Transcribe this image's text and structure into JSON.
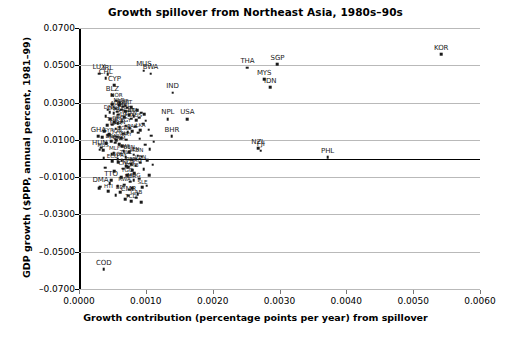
{
  "chart_data": {
    "type": "scatter",
    "title": "Growth spillover from Northeast Asia, 1980s–90s",
    "xlabel": "Growth contribution (percentage points per year) from spillover",
    "ylabel": "GDP growth ($PPP, annual percent, 1981–99)",
    "xlim": [
      0.0,
      0.006
    ],
    "ylim": [
      -0.07,
      0.07
    ],
    "xticks": [
      "0.0000",
      "0.0010",
      "0.0020",
      "0.0030",
      "0.0040",
      "0.0050",
      "0.0060"
    ],
    "xtick_values": [
      0.0,
      0.001,
      0.002,
      0.003,
      0.004,
      0.005,
      0.006
    ],
    "yticks": [
      "0.0700",
      "0.0500",
      "0.0300",
      "0.0100",
      "–0.0100",
      "–0.0300",
      "–0.0500",
      "–0.0700"
    ],
    "ytick_values": [
      0.07,
      0.05,
      0.03,
      0.01,
      -0.01,
      -0.03,
      -0.05,
      -0.07
    ],
    "grid": "horizontal",
    "legend": "none",
    "zero_line": true,
    "marker": "square",
    "marker_color": "#1a1a1a",
    "points": [
      {
        "label": "KOR",
        "x": 0.00542,
        "y": 0.056,
        "labeled": true,
        "size": "big"
      },
      {
        "label": "SGP",
        "x": 0.00297,
        "y": 0.0505,
        "labeled": true,
        "size": "big"
      },
      {
        "label": "THA",
        "x": 0.00252,
        "y": 0.0487,
        "labeled": true,
        "size": "big"
      },
      {
        "label": "MYS",
        "x": 0.00277,
        "y": 0.0425,
        "labeled": true,
        "size": "big"
      },
      {
        "label": "IDN",
        "x": 0.00286,
        "y": 0.0383,
        "labeled": true,
        "size": "big"
      },
      {
        "label": "IND",
        "x": 0.0014,
        "y": 0.0352,
        "labeled": true,
        "size": "big"
      },
      {
        "label": "NPL",
        "x": 0.00133,
        "y": 0.0212,
        "labeled": true,
        "size": "big"
      },
      {
        "label": "USA",
        "x": 0.00162,
        "y": 0.0212,
        "labeled": true,
        "size": "big"
      },
      {
        "label": "BHR",
        "x": 0.00139,
        "y": 0.012,
        "labeled": true,
        "size": "big"
      },
      {
        "label": "NZL",
        "x": 0.00268,
        "y": 0.0055,
        "labeled": true,
        "size": "big"
      },
      {
        "label": "FJI",
        "x": 0.00272,
        "y": 0.0042,
        "labeled": true,
        "size": "big"
      },
      {
        "label": "PHL",
        "x": 0.00372,
        "y": 0.0008,
        "labeled": true,
        "size": "big"
      },
      {
        "label": "MUS",
        "x": 0.00097,
        "y": 0.047,
        "labeled": true,
        "size": "big"
      },
      {
        "label": "BWA",
        "x": 0.00107,
        "y": 0.0455,
        "labeled": true,
        "size": "big"
      },
      {
        "label": "LUX",
        "x": 0.0003,
        "y": 0.0455,
        "labeled": true,
        "size": "big"
      },
      {
        "label": "IRL",
        "x": 0.00043,
        "y": 0.0452,
        "labeled": true,
        "size": "big"
      },
      {
        "label": "CHL",
        "x": 0.0004,
        "y": 0.043,
        "labeled": true,
        "size": "big"
      },
      {
        "label": "CYP",
        "x": 0.00053,
        "y": 0.0392,
        "labeled": true,
        "size": "big"
      },
      {
        "label": "BLZ",
        "x": 0.0005,
        "y": 0.034,
        "labeled": true,
        "size": "big"
      },
      {
        "label": "NOR",
        "x": 0.00056,
        "y": 0.031,
        "labeled": true
      },
      {
        "label": "GHA",
        "x": 0.00029,
        "y": 0.012,
        "labeled": true,
        "size": "big"
      },
      {
        "label": "HUN",
        "x": 0.00031,
        "y": 0.0048,
        "labeled": true,
        "size": "big"
      },
      {
        "label": "TTO",
        "x": 0.00048,
        "y": -0.0118,
        "labeled": true,
        "size": "big"
      },
      {
        "label": "DMA",
        "x": 0.00032,
        "y": -0.0152,
        "labeled": true,
        "size": "big"
      },
      {
        "label": "CMR",
        "x": 0.00074,
        "y": -0.02,
        "labeled": true,
        "size": "big"
      },
      {
        "label": "COD",
        "x": 0.00037,
        "y": -0.0595,
        "labeled": true,
        "size": "big"
      },
      {
        "label": "NLD",
        "x": 0.0006,
        "y": 0.0285,
        "labeled": true
      },
      {
        "label": "ESP",
        "x": 0.00066,
        "y": 0.0278,
        "labeled": true
      },
      {
        "label": "PRT",
        "x": 0.00072,
        "y": 0.0272,
        "labeled": true
      },
      {
        "label": "AUT",
        "x": 0.00055,
        "y": 0.0268,
        "labeled": true
      },
      {
        "label": "FIN",
        "x": 0.00063,
        "y": 0.0262,
        "labeled": true
      },
      {
        "label": "BEL",
        "x": 0.00069,
        "y": 0.0255,
        "labeled": true
      },
      {
        "label": "DNK",
        "x": 0.00046,
        "y": 0.0248,
        "labeled": true
      },
      {
        "label": "DEU",
        "x": 0.00052,
        "y": 0.0242,
        "labeled": true
      },
      {
        "label": "FRA",
        "x": 0.00059,
        "y": 0.0236,
        "labeled": true
      },
      {
        "label": "GBR",
        "x": 0.00075,
        "y": 0.0232,
        "labeled": true
      },
      {
        "label": "ITA",
        "x": 0.00082,
        "y": 0.0228,
        "labeled": true
      },
      {
        "label": "SWE",
        "x": 0.00068,
        "y": 0.022,
        "labeled": true
      },
      {
        "label": "CAN",
        "x": 0.00078,
        "y": 0.0214,
        "labeled": true
      },
      {
        "label": "AUS",
        "x": 0.00086,
        "y": 0.0205,
        "labeled": true
      },
      {
        "label": "CHE",
        "x": 0.00064,
        "y": 0.0198,
        "labeled": true
      },
      {
        "label": "GRC",
        "x": 0.00058,
        "y": 0.019,
        "labeled": true
      },
      {
        "label": "TUR",
        "x": 0.0005,
        "y": 0.0182,
        "labeled": true
      },
      {
        "label": "EGY",
        "x": 0.0007,
        "y": 0.0176,
        "labeled": true
      },
      {
        "label": "TUN",
        "x": 0.00061,
        "y": 0.0168,
        "labeled": true
      },
      {
        "label": "MAR",
        "x": 0.00055,
        "y": 0.016,
        "labeled": true
      },
      {
        "label": "LKA",
        "x": 0.00092,
        "y": 0.0152,
        "labeled": true
      },
      {
        "label": "PAK",
        "x": 0.0008,
        "y": 0.0146,
        "labeled": true
      },
      {
        "label": "ISL",
        "x": 0.00073,
        "y": 0.014,
        "labeled": true
      },
      {
        "label": "BGD",
        "x": 0.00066,
        "y": 0.0132,
        "labeled": true
      },
      {
        "label": "SYR",
        "x": 0.00044,
        "y": 0.0124,
        "labeled": true
      },
      {
        "label": "JOR",
        "x": 0.00057,
        "y": 0.0116,
        "labeled": true
      },
      {
        "label": "COL",
        "x": 0.00063,
        "y": 0.0108,
        "labeled": true
      },
      {
        "label": "URY",
        "x": 0.00071,
        "y": 0.01,
        "labeled": true
      },
      {
        "label": "BRA",
        "x": 0.00048,
        "y": 0.0092,
        "labeled": true
      },
      {
        "label": "MEX",
        "x": 0.00054,
        "y": 0.0085,
        "labeled": true
      },
      {
        "label": "VNM",
        "x": 0.0006,
        "y": 0.0078,
        "labeled": true
      },
      {
        "label": "RUS",
        "x": 0.00036,
        "y": 0.0045,
        "labeled": true
      },
      {
        "label": "MWI",
        "x": 0.00067,
        "y": 0.004,
        "labeled": true
      },
      {
        "label": "BEN",
        "x": 0.00075,
        "y": 0.0034,
        "labeled": true
      },
      {
        "label": "MLI",
        "x": 0.00052,
        "y": 0.0028,
        "labeled": true
      },
      {
        "label": "SEN",
        "x": 0.00082,
        "y": 0.002,
        "labeled": true
      },
      {
        "label": "KEN",
        "x": 0.00088,
        "y": 0.0014,
        "labeled": true
      },
      {
        "label": "ZWE",
        "x": 0.0007,
        "y": 0.0006,
        "labeled": true
      },
      {
        "label": "BOL",
        "x": 0.00058,
        "y": -0.0004,
        "labeled": true
      },
      {
        "label": "PRY",
        "x": 0.00064,
        "y": -0.001,
        "labeled": true
      },
      {
        "label": "ECU",
        "x": 0.0005,
        "y": -0.0016,
        "labeled": true
      },
      {
        "label": "VEN",
        "x": 0.00092,
        "y": -0.0022,
        "labeled": true
      },
      {
        "label": "PER",
        "x": 0.00078,
        "y": -0.003,
        "labeled": true
      },
      {
        "label": "ARG",
        "x": 0.00085,
        "y": -0.0038,
        "labeled": true
      },
      {
        "label": "NGA",
        "x": 0.00074,
        "y": -0.0046,
        "labeled": true
      },
      {
        "label": "CIV",
        "x": 0.00066,
        "y": -0.0054,
        "labeled": true
      },
      {
        "label": "ZMB",
        "x": 0.0008,
        "y": -0.0062,
        "labeled": true
      },
      {
        "label": "TGO",
        "x": 0.00072,
        "y": -0.009,
        "labeled": true
      },
      {
        "label": "NER",
        "x": 0.00077,
        "y": -0.0125,
        "labeled": true
      },
      {
        "label": "RWA",
        "x": 0.00068,
        "y": -0.014,
        "labeled": true
      },
      {
        "label": "MDG",
        "x": 0.00082,
        "y": -0.0118,
        "labeled": true
      },
      {
        "label": "SLE",
        "x": 0.00095,
        "y": -0.0155,
        "labeled": true
      },
      {
        "label": "BDI",
        "x": 0.00062,
        "y": -0.0182,
        "labeled": true
      },
      {
        "label": "HTI",
        "x": 0.00044,
        "y": -0.0175,
        "labeled": true
      },
      {
        "label": "GAB",
        "x": 0.00086,
        "y": -0.021,
        "labeled": true
      },
      {
        "label": "TCD",
        "x": 0.00078,
        "y": -0.0228,
        "labeled": true
      }
    ],
    "extra_points": [
      {
        "x": 0.0005,
        "y": 0.029
      },
      {
        "x": 0.00061,
        "y": 0.0296
      },
      {
        "x": 0.0007,
        "y": 0.0284
      },
      {
        "x": 0.00078,
        "y": 0.0276
      },
      {
        "x": 0.00043,
        "y": 0.0262
      },
      {
        "x": 0.00087,
        "y": 0.0258
      },
      {
        "x": 0.00093,
        "y": 0.0246
      },
      {
        "x": 0.00057,
        "y": 0.0252
      },
      {
        "x": 0.00098,
        "y": 0.0238
      },
      {
        "x": 0.0004,
        "y": 0.0226
      },
      {
        "x": 0.0009,
        "y": 0.0218
      },
      {
        "x": 0.00047,
        "y": 0.021
      },
      {
        "x": 0.001,
        "y": 0.0202
      },
      {
        "x": 0.00053,
        "y": 0.0194
      },
      {
        "x": 0.00096,
        "y": 0.0186
      },
      {
        "x": 0.00042,
        "y": 0.0178
      },
      {
        "x": 0.00084,
        "y": 0.017
      },
      {
        "x": 0.00076,
        "y": 0.0162
      },
      {
        "x": 0.00104,
        "y": 0.0154
      },
      {
        "x": 0.00038,
        "y": 0.0146
      },
      {
        "x": 0.00089,
        "y": 0.0138
      },
      {
        "x": 0.00045,
        "y": 0.013
      },
      {
        "x": 0.00108,
        "y": 0.0122
      },
      {
        "x": 0.00035,
        "y": 0.0114
      },
      {
        "x": 0.00091,
        "y": 0.0106
      },
      {
        "x": 0.00056,
        "y": 0.0098
      },
      {
        "x": 0.00112,
        "y": 0.009
      },
      {
        "x": 0.00041,
        "y": 0.0082
      },
      {
        "x": 0.00099,
        "y": 0.0074
      },
      {
        "x": 0.00065,
        "y": 0.0066
      },
      {
        "x": 0.00033,
        "y": 0.0058
      },
      {
        "x": 0.00106,
        "y": 0.005
      },
      {
        "x": 0.00049,
        "y": 0.0024
      },
      {
        "x": 0.00094,
        "y": 0.001
      },
      {
        "x": 0.00037,
        "y": 0.0002
      },
      {
        "x": 0.00102,
        "y": -0.0008
      },
      {
        "x": 0.00059,
        "y": -0.002
      },
      {
        "x": 0.0011,
        "y": -0.0034
      },
      {
        "x": 0.00071,
        "y": -0.0042
      },
      {
        "x": 0.00039,
        "y": -0.005
      },
      {
        "x": 0.00097,
        "y": -0.0058
      },
      {
        "x": 0.00053,
        "y": -0.0068
      },
      {
        "x": 0.00083,
        "y": -0.0078
      },
      {
        "x": 0.00063,
        "y": -0.01
      },
      {
        "x": 0.0009,
        "y": -0.0108
      },
      {
        "x": 0.00046,
        "y": -0.0132
      },
      {
        "x": 0.00101,
        "y": -0.0146
      },
      {
        "x": 0.0003,
        "y": -0.016
      },
      {
        "x": 0.00075,
        "y": -0.0168
      },
      {
        "x": 0.00088,
        "y": -0.019
      },
      {
        "x": 0.00055,
        "y": -0.0196
      },
      {
        "x": 0.00069,
        "y": -0.0218
      },
      {
        "x": 0.00093,
        "y": -0.0236
      },
      {
        "x": 0.0008,
        "y": -0.016
      },
      {
        "x": 0.00058,
        "y": -0.015
      },
      {
        "x": 0.00105,
        "y": -0.009
      }
    ]
  }
}
